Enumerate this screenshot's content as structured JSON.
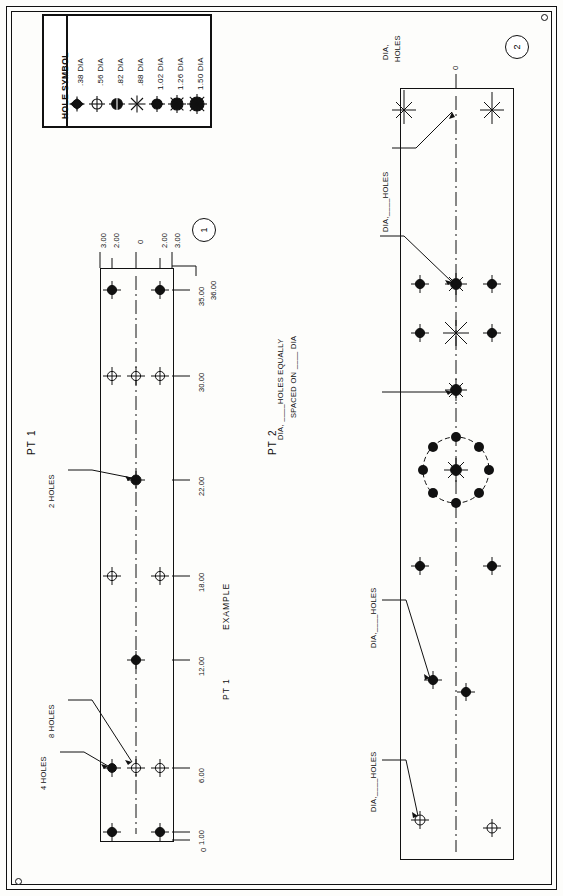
{
  "sheet": {
    "background_color": "#fdfdfb",
    "line_color": "#111111",
    "orientation": "landscape-rotated-90"
  },
  "legend": {
    "title": "HOLE SYMBOL",
    "rows": [
      {
        "symbol": "hole-symbol-038",
        "label": ".38 DIA"
      },
      {
        "symbol": "hole-symbol-056",
        "label": ".56 DIA"
      },
      {
        "symbol": "hole-symbol-082",
        "label": ".82 DIA"
      },
      {
        "symbol": "hole-symbol-088",
        "label": ".88 DIA"
      },
      {
        "symbol": "hole-symbol-102",
        "label": "1.02 DIA"
      },
      {
        "symbol": "hole-symbol-126",
        "label": "1.26 DIA"
      },
      {
        "symbol": "hole-symbol-150",
        "label": "1.50 DIA"
      }
    ]
  },
  "part1": {
    "title": "PT 1",
    "balloon": "1",
    "example_label": "EXAMPLE",
    "example_part": "PT 1",
    "horizontal_dims": [
      "0",
      "1.00",
      "6.00",
      "12.00",
      "18.00",
      "22.00",
      "30.00",
      "35.00",
      "36.00"
    ],
    "vertical_dims": [
      "3.00",
      "2.00",
      "0",
      "2.00",
      "3.00"
    ],
    "callouts": [
      {
        "name": "callout-4-holes",
        "text": "4 HOLES"
      },
      {
        "name": "callout-8-holes",
        "text": "8 HOLES"
      },
      {
        "name": "callout-2-holes",
        "text": "2 HOLES"
      }
    ]
  },
  "part2": {
    "title": "PT 2",
    "balloon": "2",
    "zero_label": "0",
    "callouts": [
      {
        "name": "callout-dia-holes-1",
        "text": "DIA,____HOLES"
      },
      {
        "name": "callout-dia-holes-2",
        "text": "DIA,____HOLES"
      },
      {
        "name": "callout-bolt-circle",
        "line1": "DIA, ____HOLES EQUALLY",
        "line2": "SPACED ON ____ DIA"
      },
      {
        "name": "callout-dia-holes-3",
        "text": "DIA,____HOLES"
      },
      {
        "name": "callout-dia-holes-4",
        "line1": "DIA,",
        "line2": "HOLES"
      }
    ]
  }
}
